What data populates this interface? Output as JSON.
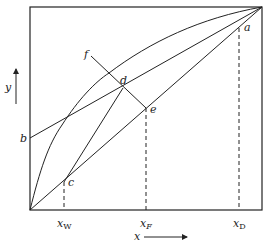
{
  "diagram": {
    "type": "McCabe-Thiele x-y distillation diagram",
    "axes": {
      "x_label": "x",
      "y_label": "y"
    },
    "points": {
      "a": "a",
      "b": "b",
      "c": "c",
      "d": "d",
      "e": "e",
      "f": "f"
    },
    "x_ticks": {
      "xw_main": "x",
      "xw_sub": "W",
      "xf_main": "x",
      "xf_sub": "F",
      "xd_main": "x",
      "xd_sub": "D"
    },
    "colors": {
      "line": "#222222",
      "background": "#ffffff"
    }
  }
}
